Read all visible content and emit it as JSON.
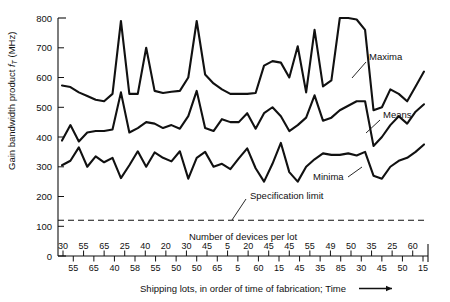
{
  "chart_data": {
    "type": "line",
    "title": "",
    "ylabel": "Gain bandwidth product f_T (MHz)",
    "ylabel_main": "Gain bandwidth product",
    "ylabel_symbol": "f",
    "ylabel_subscript": "T",
    "ylabel_units": "(MHz)",
    "xlabel": "Shipping lots, in order of time of fabrication; Time",
    "xlabel_arrow": "⟶",
    "ylim": [
      0,
      800
    ],
    "yticks": [
      0,
      100,
      200,
      300,
      400,
      500,
      600,
      700,
      800
    ],
    "grid": false,
    "legend_position": "inline-annotations",
    "devices_row_label": "Number of devices per lot",
    "devices_per_lot": [
      30,
      55,
      55,
      65,
      65,
      40,
      25,
      58,
      40,
      55,
      20,
      50,
      30,
      50,
      45,
      65,
      5,
      5,
      20,
      60,
      45,
      15,
      45,
      45,
      55,
      35,
      49,
      85,
      50,
      30,
      35,
      45,
      25,
      50,
      60,
      15
    ],
    "devices_row_upper": [
      30,
      55,
      65,
      25,
      40,
      20,
      30,
      45,
      5,
      20,
      45,
      45,
      55,
      49,
      50,
      35,
      25,
      60
    ],
    "devices_row_lower": [
      55,
      65,
      40,
      58,
      55,
      50,
      50,
      65,
      5,
      60,
      15,
      45,
      35,
      85,
      30,
      45,
      50,
      15
    ],
    "spec_limit": 120,
    "spec_limit_label": "Specification limit",
    "series": [
      {
        "name": "Maxima",
        "label": "Maxima",
        "values": [
          573,
          568,
          550,
          538,
          525,
          520,
          545,
          790,
          545,
          545,
          700,
          555,
          548,
          552,
          555,
          600,
          790,
          610,
          580,
          560,
          545,
          545,
          545,
          548,
          640,
          655,
          650,
          600,
          705,
          550,
          760,
          570,
          590,
          800,
          800,
          795,
          760,
          490,
          500,
          560,
          545,
          520,
          570,
          620
        ]
      },
      {
        "name": "Means",
        "label": "Means",
        "values": [
          388,
          440,
          385,
          415,
          420,
          420,
          425,
          550,
          415,
          430,
          450,
          445,
          430,
          440,
          428,
          470,
          555,
          430,
          420,
          460,
          450,
          450,
          480,
          428,
          480,
          500,
          470,
          420,
          440,
          465,
          540,
          455,
          465,
          490,
          505,
          520,
          520,
          370,
          400,
          440,
          470,
          445,
          485,
          510
        ]
      },
      {
        "name": "Minima",
        "label": "Minima",
        "values": [
          305,
          320,
          365,
          300,
          335,
          315,
          330,
          262,
          305,
          352,
          300,
          348,
          330,
          318,
          352,
          260,
          330,
          350,
          300,
          310,
          292,
          328,
          362,
          295,
          250,
          310,
          380,
          282,
          250,
          300,
          325,
          345,
          340,
          340,
          345,
          338,
          350,
          270,
          260,
          300,
          320,
          330,
          350,
          375
        ]
      }
    ]
  },
  "annotations": {
    "maxima": "Maxima",
    "means": "Means",
    "minima": "Minima",
    "spec": "Specification limit",
    "devices": "Number of devices per lot"
  }
}
